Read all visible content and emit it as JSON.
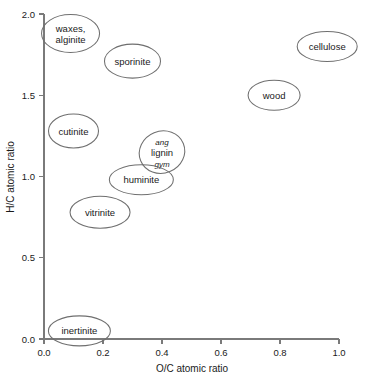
{
  "chart_data": {
    "type": "scatter",
    "title": "",
    "xlabel": "O/C atomic ratio",
    "ylabel": "H/C atomic ratio",
    "xlim": [
      0.0,
      1.0
    ],
    "ylim": [
      0.0,
      2.0
    ],
    "grid": false,
    "legend": "none",
    "xticks": [
      "0.0",
      "0.2",
      "0.4",
      "0.6",
      "0.8",
      "1.0"
    ],
    "xtick_values": [
      0.0,
      0.2,
      0.4,
      0.6,
      0.8,
      1.0
    ],
    "yticks": [
      "0.0",
      "0.5",
      "1.0",
      "1.5",
      "2.0"
    ],
    "ytick_values": [
      0.0,
      0.5,
      1.0,
      1.5,
      2.0
    ],
    "marker_shape": "ellipse",
    "points": [
      {
        "name": "waxes-alginite",
        "label": "waxes, alginite",
        "lines": [
          "waxes,",
          "alginite"
        ],
        "styles": [
          "normal",
          "normal"
        ],
        "x": 0.09,
        "y": 1.88,
        "rx": 29,
        "ry": 19,
        "rotate": 0
      },
      {
        "name": "sporinite",
        "label": "sporinite",
        "lines": [
          "sporinite"
        ],
        "styles": [
          "normal"
        ],
        "x": 0.3,
        "y": 1.71,
        "rx": 28,
        "ry": 17,
        "rotate": 0
      },
      {
        "name": "cellulose",
        "label": "cellulose",
        "lines": [
          "cellulose"
        ],
        "styles": [
          "normal"
        ],
        "x": 0.96,
        "y": 1.8,
        "rx": 30,
        "ry": 15,
        "rotate": 0
      },
      {
        "name": "wood",
        "label": "wood",
        "lines": [
          "wood"
        ],
        "styles": [
          "normal"
        ],
        "x": 0.78,
        "y": 1.5,
        "rx": 26,
        "ry": 15,
        "rotate": 0
      },
      {
        "name": "cutinite",
        "label": "cutinite",
        "lines": [
          "cutinite"
        ],
        "styles": [
          "normal"
        ],
        "x": 0.1,
        "y": 1.28,
        "rx": 25,
        "ry": 17,
        "rotate": 0
      },
      {
        "name": "lignin",
        "label": "ang lignin gym",
        "lines": [
          "ang",
          "lignin",
          "gym"
        ],
        "styles": [
          "italic",
          "normal",
          "italic"
        ],
        "x": 0.4,
        "y": 1.15,
        "rx": 23,
        "ry": 21,
        "rotate": -22
      },
      {
        "name": "huminite",
        "label": "huminite",
        "lines": [
          "huminite"
        ],
        "styles": [
          "normal"
        ],
        "x": 0.33,
        "y": 0.98,
        "rx": 32,
        "ry": 15,
        "rotate": 0
      },
      {
        "name": "vitrinite",
        "label": "vitrinite",
        "lines": [
          "vitrinite"
        ],
        "styles": [
          "normal"
        ],
        "x": 0.19,
        "y": 0.78,
        "rx": 30,
        "ry": 16,
        "rotate": 0
      },
      {
        "name": "inertinite",
        "label": "inertinite",
        "lines": [
          "inertinite"
        ],
        "styles": [
          "normal"
        ],
        "x": 0.12,
        "y": 0.05,
        "rx": 31,
        "ry": 15,
        "rotate": 0
      }
    ]
  }
}
